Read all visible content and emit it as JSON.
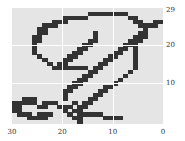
{
  "chart_data": {
    "type": "heatmap",
    "title": "",
    "xlabel": "",
    "ylabel": "",
    "xlim": [
      30,
      0
    ],
    "ylim": [
      0,
      29
    ],
    "x_ticks": [
      "30",
      "20",
      "10",
      "0"
    ],
    "y_ticks": [
      "29",
      "20",
      "10"
    ],
    "grid": true,
    "colors": {
      "background": "#e5e5e5",
      "on": "#333333",
      "grid": "#ffffff"
    },
    "rows": 30,
    "cols": 30,
    "bitmap": [
      "..............................",
      "...............########.......",
      "..........#####........##.....",
      "........###.............##..##",
      "......###................####.",
      ".....##...................#...",
      ".....##.........#........##...",
      "....##..........#.......###...",
      "....##.........##......###....",
      "....#.........##......###.....",
      "....#........##......##.#.....",
      "....#.......##......##..#.....",
      ".....#.....##......##...#.....",
      "......#...##......##....#.....",
      ".......#.##......##.....#.....",
      "........#######.##......#.....",
      "...............##......#......",
      "..............##......#.......",
      ".............##......#........",
      "............##......#.........",
      "...........##.....##..........",
      "..........##.....##...........",
      "..........#.....##............",
      "..###.....#....##.............",
      "#####.###...#.##..............",
      "##...##..###.##...............",
      "##........#.##................",
      ".###.###...#.#####............",
      "...####.....##....####........",
      ".............#................"
    ]
  }
}
